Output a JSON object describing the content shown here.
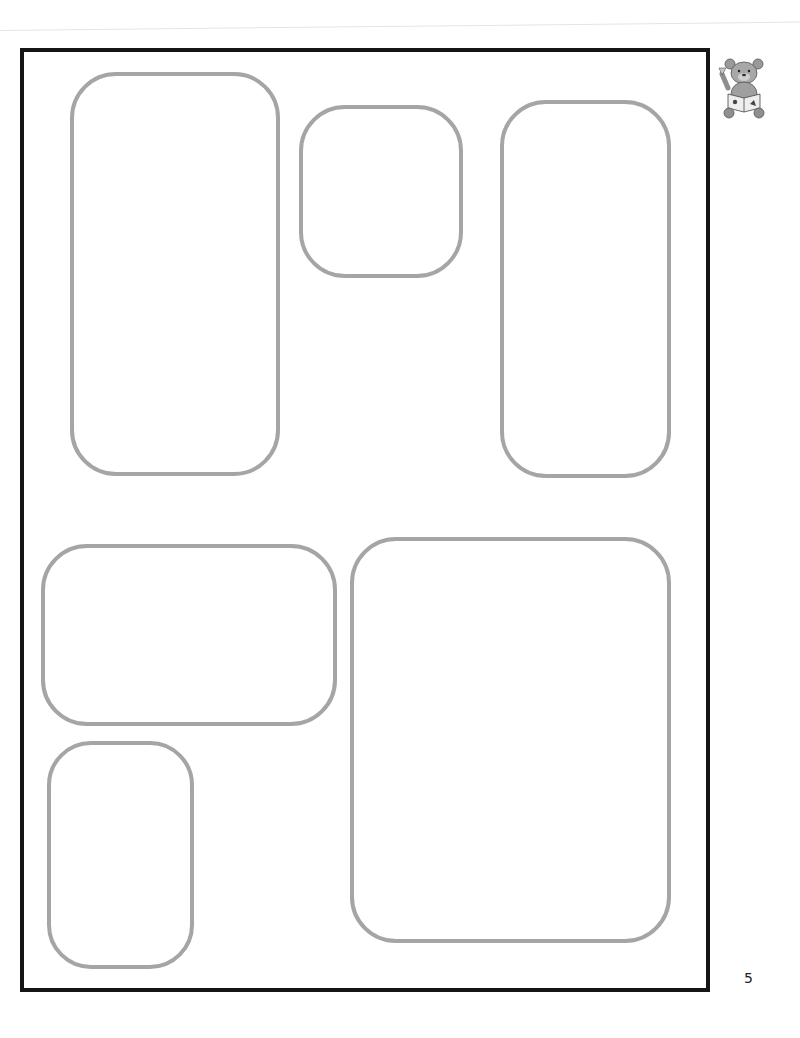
{
  "page": {
    "page_number": "5",
    "mascot_icon": "teddy-bear-reading-book-icon",
    "colors": {
      "frame_border": "#151515",
      "panel_border": "#a5a5a5",
      "background": "#ffffff"
    },
    "panels": [
      {
        "id": "panel-1",
        "shape": "tall rounded rectangle",
        "x": 70,
        "y": 72,
        "w": 210,
        "h": 404
      },
      {
        "id": "panel-2",
        "shape": "rounded square",
        "x": 299,
        "y": 105,
        "w": 164,
        "h": 173
      },
      {
        "id": "panel-3",
        "shape": "tall rounded rectangle",
        "x": 500,
        "y": 100,
        "w": 171,
        "h": 378
      },
      {
        "id": "panel-4",
        "shape": "wide rounded rectangle",
        "x": 41,
        "y": 544,
        "w": 296,
        "h": 182
      },
      {
        "id": "panel-5",
        "shape": "large rounded rectangle",
        "x": 350,
        "y": 537,
        "w": 321,
        "h": 406
      },
      {
        "id": "panel-6",
        "shape": "small tall rounded rectangle",
        "x": 47,
        "y": 741,
        "w": 147,
        "h": 228
      }
    ]
  }
}
